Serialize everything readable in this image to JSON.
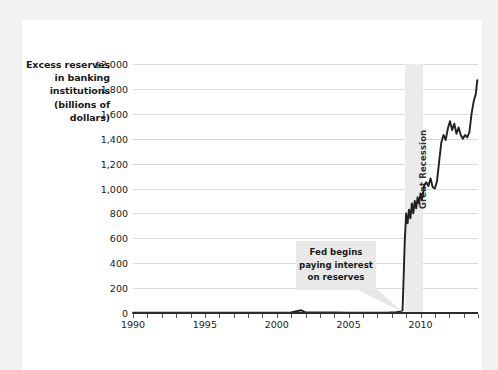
{
  "colors": {
    "page": "#ffffff",
    "mat": "#f2f2f2",
    "line": "#231f20",
    "grid": "#dcdcdc",
    "band": "#ebebeb",
    "axis": "#2b2b2b",
    "callout_bg": "#e9e9e9",
    "text": "#1a1a1a"
  },
  "axis_title": {
    "lines": [
      "Excess reserves",
      "in banking",
      "institutions",
      "(billions of",
      "dollars)"
    ]
  },
  "annotations": {
    "recession": {
      "label": "Great Recession",
      "x_start": 2008.9,
      "x_end": 2010.2
    },
    "callout": {
      "lines": [
        "Fed begins",
        "paying interest",
        "on reserves"
      ],
      "target_x": 2008.75,
      "target_y": 0
    }
  },
  "chart_data": {
    "type": "line",
    "title": "",
    "xlabel": "",
    "ylabel": "Excess reserves in banking institutions (billions of dollars)",
    "xlim": [
      1990,
      2014
    ],
    "ylim": [
      0,
      2000
    ],
    "grid": true,
    "legend": null,
    "y_ticks": [
      0,
      200,
      400,
      600,
      800,
      1000,
      1200,
      1400,
      1600,
      1800,
      2000
    ],
    "y_tick_labels": [
      "0",
      "200",
      "400",
      "600",
      "800",
      "1,000",
      "1,200",
      "1,400",
      "1,600",
      "1,800",
      "$2,000"
    ],
    "x_ticks": [
      1990,
      1991,
      1992,
      1993,
      1994,
      1995,
      1996,
      1997,
      1998,
      1999,
      2000,
      2001,
      2002,
      2003,
      2004,
      2005,
      2006,
      2007,
      2008,
      2009,
      2010,
      2011,
      2012,
      2013,
      2014
    ],
    "x_tick_labels": [
      {
        "x": 1990,
        "label": "1990"
      },
      {
        "x": 1995,
        "label": "1995"
      },
      {
        "x": 2000,
        "label": "2000"
      },
      {
        "x": 2005,
        "label": "2005"
      },
      {
        "x": 2010,
        "label": "2010"
      }
    ],
    "series": [
      {
        "name": "Excess reserves",
        "x": [
          1990,
          1991,
          1992,
          1993,
          1994,
          1995,
          1996,
          1997,
          1998,
          1999,
          2000,
          2001,
          2001.7,
          2002,
          2003,
          2004,
          2005,
          2006,
          2007,
          2007.8,
          2008.0,
          2008.3,
          2008.6,
          2008.75,
          2008.8,
          2008.9,
          2009.0,
          2009.1,
          2009.2,
          2009.3,
          2009.4,
          2009.5,
          2009.6,
          2009.7,
          2009.8,
          2009.9,
          2010.0,
          2010.1,
          2010.25,
          2010.4,
          2010.55,
          2010.7,
          2010.85,
          2011.0,
          2011.15,
          2011.3,
          2011.45,
          2011.6,
          2011.75,
          2011.9,
          2012.05,
          2012.2,
          2012.35,
          2012.5,
          2012.65,
          2012.8,
          2012.95,
          2013.1,
          2013.25,
          2013.4,
          2013.55,
          2013.7,
          2013.85,
          2013.95
        ],
        "y": [
          2,
          2,
          3,
          3,
          3,
          3,
          2,
          2,
          2,
          3,
          3,
          5,
          22,
          5,
          4,
          4,
          3,
          3,
          3,
          4,
          5,
          6,
          10,
          20,
          180,
          560,
          800,
          720,
          830,
          760,
          880,
          800,
          900,
          840,
          930,
          880,
          960,
          910,
          1020,
          1050,
          1020,
          1080,
          1010,
          1000,
          1060,
          1220,
          1370,
          1430,
          1390,
          1480,
          1540,
          1470,
          1520,
          1440,
          1490,
          1430,
          1400,
          1430,
          1410,
          1450,
          1600,
          1700,
          1760,
          1870
        ]
      }
    ]
  }
}
